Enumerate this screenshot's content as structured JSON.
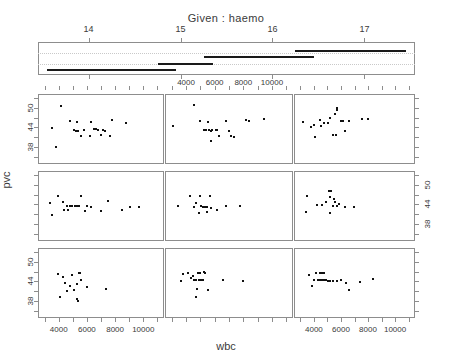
{
  "chart_data": {
    "type": "scatter",
    "plot_kind": "coplot",
    "title": "Given : haemo",
    "xlabel": "wbc",
    "ylabel": "pvc",
    "given_variable": "haemo",
    "given_axis": {
      "ticks": [
        14,
        15,
        16,
        17
      ],
      "range": [
        13.45,
        17.55
      ],
      "gridlines": 2
    },
    "given_intervals": [
      {
        "index": 1,
        "from": 13.55,
        "to": 14.35,
        "level": 1
      },
      {
        "index": 2,
        "from": 14.25,
        "to": 14.75,
        "level": 1
      },
      {
        "index": 3,
        "from": 14.55,
        "to": 14.95,
        "level": 1
      },
      {
        "index": 4,
        "from": 14.75,
        "to": 15.05,
        "level": 2
      },
      {
        "index": 5,
        "from": 14.95,
        "to": 15.15,
        "level": 2
      },
      {
        "index": 6,
        "from": 15.05,
        "to": 15.35,
        "level": 2
      },
      {
        "index": 7,
        "from": 15.25,
        "to": 15.65,
        "level": 3
      },
      {
        "index": 8,
        "from": 15.55,
        "to": 16.05,
        "level": 3
      },
      {
        "index": 9,
        "from": 15.95,
        "to": 16.45,
        "level": 3
      },
      {
        "index": 10,
        "from": 16.25,
        "to": 17.45,
        "level": 4
      }
    ],
    "x_axis": {
      "ticks": [
        4000,
        6000,
        8000,
        10000
      ],
      "minor_ticks": [
        3000,
        5000,
        7000,
        9000,
        11000
      ],
      "range": [
        2600,
        11400
      ],
      "tick_labels": [
        "4000",
        "6000",
        "8000",
        "10000"
      ]
    },
    "y_axis": {
      "ticks": [
        38,
        44,
        50
      ],
      "range": [
        33,
        54
      ],
      "tick_labels": [
        "38",
        "44",
        "50"
      ]
    },
    "panel_layout": {
      "rows": 3,
      "cols": 3,
      "panel_order": "bottom-left-to-top-right"
    },
    "panels": [
      {
        "row": 1,
        "col": 1,
        "given_index": 7,
        "points": [
          [
            3450,
            44.0
          ],
          [
            4100,
            50.8
          ],
          [
            4750,
            46.2
          ],
          [
            5150,
            43.2
          ],
          [
            5300,
            43.1
          ],
          [
            5500,
            41.6
          ],
          [
            5000,
            43.4
          ],
          [
            5700,
            43.6
          ],
          [
            6250,
            46.0
          ],
          [
            6450,
            43.9
          ],
          [
            6600,
            43.7
          ],
          [
            6700,
            43.6
          ],
          [
            6950,
            41.9
          ],
          [
            7050,
            43.4
          ],
          [
            7200,
            43.3
          ],
          [
            7600,
            41.7
          ],
          [
            7700,
            46.7
          ],
          [
            3700,
            38.2
          ],
          [
            8700,
            45.6
          ],
          [
            5250,
            46.1
          ],
          [
            6150,
            41.8
          ]
        ]
      },
      {
        "row": 1,
        "col": 2,
        "given_index": 8,
        "points": [
          [
            3050,
            44.6
          ],
          [
            4500,
            51.2
          ],
          [
            4900,
            46.3
          ],
          [
            5200,
            43.5
          ],
          [
            5350,
            43.4
          ],
          [
            5500,
            43.4
          ],
          [
            5700,
            43.3
          ],
          [
            5750,
            43.6
          ],
          [
            6000,
            43.4
          ],
          [
            6250,
            41.6
          ],
          [
            6700,
            46.2
          ],
          [
            6900,
            43.2
          ],
          [
            7100,
            41.5
          ],
          [
            7300,
            41.3
          ],
          [
            8100,
            46.5
          ],
          [
            8350,
            46.4
          ],
          [
            9400,
            47.0
          ],
          [
            5650,
            40.2
          ],
          [
            5450,
            46.1
          ],
          [
            6100,
            43.5
          ]
        ]
      },
      {
        "row": 1,
        "col": 3,
        "given_index": 9,
        "points": [
          [
            3150,
            46.0
          ],
          [
            3900,
            45.0
          ],
          [
            4350,
            46.6
          ],
          [
            4700,
            45.6
          ],
          [
            4950,
            45.7
          ],
          [
            5150,
            47.2
          ],
          [
            5500,
            48.5
          ],
          [
            5600,
            49.8
          ],
          [
            5650,
            50.4
          ],
          [
            5900,
            46.4
          ],
          [
            6100,
            46.3
          ],
          [
            6250,
            43.2
          ],
          [
            6500,
            46.4
          ],
          [
            7500,
            46.8
          ],
          [
            7900,
            46.9
          ],
          [
            4000,
            41.4
          ],
          [
            5350,
            42.0
          ],
          [
            5550,
            42.0
          ],
          [
            4450,
            44.6
          ],
          [
            3700,
            44.4
          ]
        ]
      },
      {
        "row": 2,
        "col": 1,
        "given_index": 4,
        "points": [
          [
            3300,
            44.6
          ],
          [
            3900,
            46.8
          ],
          [
            4200,
            45.0
          ],
          [
            4500,
            43.9
          ],
          [
            4700,
            43.9
          ],
          [
            4900,
            43.8
          ],
          [
            5050,
            43.8
          ],
          [
            5200,
            43.9
          ],
          [
            5350,
            43.7
          ],
          [
            5500,
            46.9
          ],
          [
            4300,
            42.6
          ],
          [
            4600,
            42.5
          ],
          [
            5800,
            42.4
          ],
          [
            6250,
            43.5
          ],
          [
            6900,
            42.4
          ],
          [
            7400,
            45.5
          ],
          [
            8400,
            42.6
          ],
          [
            9000,
            43.4
          ],
          [
            9600,
            43.4
          ],
          [
            3450,
            40.9
          ],
          [
            5900,
            43.9
          ]
        ]
      },
      {
        "row": 2,
        "col": 2,
        "given_index": 5,
        "points": [
          [
            3350,
            43.9
          ],
          [
            4200,
            46.8
          ],
          [
            4600,
            44.7
          ],
          [
            4900,
            46.9
          ],
          [
            5000,
            43.7
          ],
          [
            5100,
            43.6
          ],
          [
            5250,
            43.5
          ],
          [
            5400,
            43.5
          ],
          [
            5600,
            46.8
          ],
          [
            5700,
            43.2
          ],
          [
            5400,
            41.9
          ],
          [
            4850,
            41.6
          ],
          [
            6700,
            43.8
          ],
          [
            7700,
            43.7
          ],
          [
            6100,
            42.6
          ],
          [
            4500,
            43.6
          ]
        ]
      },
      {
        "row": 2,
        "col": 3,
        "given_index": 6,
        "points": [
          [
            3400,
            46.9
          ],
          [
            4150,
            44.0
          ],
          [
            4500,
            44.0
          ],
          [
            5050,
            48.4
          ],
          [
            5200,
            48.4
          ],
          [
            5100,
            46.7
          ],
          [
            5400,
            46.0
          ],
          [
            5500,
            45.0
          ],
          [
            5300,
            43.8
          ],
          [
            5600,
            43.7
          ],
          [
            6200,
            43.6
          ],
          [
            6900,
            43.6
          ],
          [
            3350,
            42.0
          ],
          [
            5150,
            41.7
          ],
          [
            4800,
            45.0
          ],
          [
            5750,
            44.5
          ]
        ]
      },
      {
        "row": 3,
        "col": 1,
        "given_index": 1,
        "points": [
          [
            3850,
            46.5
          ],
          [
            4200,
            45.8
          ],
          [
            4900,
            46.2
          ],
          [
            5350,
            47.0
          ],
          [
            5450,
            47.0
          ],
          [
            4350,
            43.9
          ],
          [
            5200,
            43.4
          ],
          [
            5500,
            44.8
          ],
          [
            4700,
            42.8
          ],
          [
            5000,
            41.7
          ],
          [
            4550,
            41.3
          ],
          [
            5900,
            42.7
          ],
          [
            7300,
            42.1
          ],
          [
            4050,
            39.5
          ],
          [
            5200,
            38.9
          ],
          [
            5300,
            38.4
          ]
        ]
      },
      {
        "row": 3,
        "col": 2,
        "given_index": 2,
        "points": [
          [
            3700,
            46.7
          ],
          [
            4100,
            46.9
          ],
          [
            4450,
            46.1
          ],
          [
            4750,
            47.0
          ],
          [
            4900,
            46.9
          ],
          [
            5150,
            47.1
          ],
          [
            5250,
            47.0
          ],
          [
            4250,
            45.3
          ],
          [
            4500,
            44.8
          ],
          [
            4650,
            44.7
          ],
          [
            4800,
            44.6
          ],
          [
            4950,
            44.7
          ],
          [
            5100,
            44.6
          ],
          [
            3600,
            44.3
          ],
          [
            6500,
            44.6
          ],
          [
            7900,
            44.4
          ],
          [
            4700,
            41.9
          ],
          [
            5450,
            41.6
          ],
          [
            4650,
            39.6
          ]
        ]
      },
      {
        "row": 3,
        "col": 3,
        "given_index": 3,
        "points": [
          [
            3550,
            46.4
          ],
          [
            4050,
            46.8
          ],
          [
            4350,
            46.9
          ],
          [
            4500,
            46.9
          ],
          [
            4700,
            47.0
          ],
          [
            4250,
            44.8
          ],
          [
            4400,
            44.7
          ],
          [
            4550,
            44.7
          ],
          [
            4700,
            44.6
          ],
          [
            4850,
            44.6
          ],
          [
            5000,
            44.5
          ],
          [
            5150,
            44.4
          ],
          [
            5300,
            44.5
          ],
          [
            3900,
            44.6
          ],
          [
            5600,
            44.5
          ],
          [
            5900,
            44.6
          ],
          [
            6300,
            43.9
          ],
          [
            7300,
            44.2
          ],
          [
            8300,
            44.9
          ],
          [
            3750,
            43.0
          ],
          [
            6500,
            41.8
          ]
        ]
      }
    ]
  },
  "labels": {
    "given_title": "Given : haemo",
    "x_axis_name": "wbc",
    "y_axis_name": "pvc"
  }
}
